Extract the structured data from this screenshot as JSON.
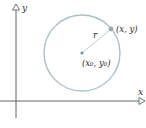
{
  "diagram": {
    "axes": {
      "x_label": "x",
      "y_label": "y",
      "color": "#6f7880"
    },
    "circle": {
      "color": "#a9bfc9",
      "center_label": "(x₀, y₀)",
      "center_color": "#6f8fb0",
      "radius_label": "r",
      "point_label": "(x, y)",
      "point_color": "#9aa7ad"
    }
  }
}
